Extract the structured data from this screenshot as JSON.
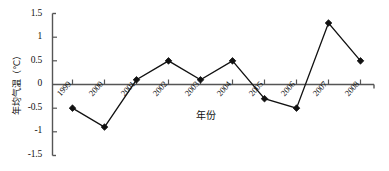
{
  "chart_data": {
    "type": "line",
    "title": "",
    "xlabel": "年份",
    "ylabel": "年均气温（℃）",
    "categories": [
      "1999",
      "2000",
      "2001",
      "2002",
      "2003",
      "2004",
      "2005",
      "2006",
      "2007",
      "2008"
    ],
    "values": [
      -0.5,
      -0.9,
      0.1,
      0.5,
      0.1,
      0.5,
      -0.3,
      -0.5,
      1.3,
      0.5
    ],
    "series": [
      {
        "name": "年均气温",
        "values": [
          -0.5,
          -0.9,
          0.1,
          0.5,
          0.1,
          0.5,
          -0.3,
          -0.5,
          1.3,
          0.5
        ]
      }
    ],
    "ylim": [
      -1.5,
      1.5
    ],
    "ytick_labels": [
      "1.5",
      "1",
      "0.5",
      "0",
      "-0.5",
      "-1",
      "-1.5"
    ],
    "ytick_values": [
      1.5,
      1,
      0.5,
      0,
      -0.5,
      -1,
      -1.5
    ],
    "grid": false,
    "legend": "none",
    "marker": "diamond",
    "line_color": "#111111",
    "marker_color": "#111111",
    "axis_color": "#555555",
    "background": "#ffffff"
  },
  "axes": {
    "y_title": "年均气温（℃）",
    "x_title": "年份"
  }
}
